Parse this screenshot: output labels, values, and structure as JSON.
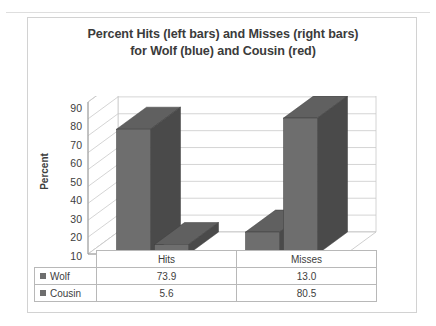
{
  "top_fragment": {
    "ghost_text": "· ·· ··"
  },
  "chart_data": {
    "type": "bar",
    "title_lines": [
      "Percent Hits (left bars) and Misses (right bars)",
      "for Wolf (blue) and Cousin (red)"
    ],
    "title": "Percent Hits (left bars) and Misses (right bars) for Wolf (blue) and Cousin (red)",
    "xlabel": "",
    "ylabel": "Percent",
    "ylim": [
      0,
      90
    ],
    "ytick_step": 10,
    "yticks": [
      "90",
      "80",
      "70",
      "60",
      "50",
      "40",
      "30",
      "20",
      "10",
      "0"
    ],
    "grid": true,
    "three_d": true,
    "legend_position": "data-table",
    "categories": [
      "Hits",
      "Misses"
    ],
    "series": [
      {
        "name": "Wolf",
        "values": [
          73.9,
          13.0
        ],
        "color": "#6e6e6e"
      },
      {
        "name": "Cousin",
        "values": [
          5.6,
          80.5
        ],
        "color": "#6e6e6e"
      }
    ],
    "table": {
      "header": [
        "",
        "Hits",
        "Misses"
      ],
      "rows": [
        {
          "label": "Wolf",
          "values": [
            "73.9",
            "13.0"
          ]
        },
        {
          "label": "Cousin",
          "values": [
            "5.6",
            "80.5"
          ]
        }
      ]
    },
    "colors": {
      "bar_front": "#6e6e6e",
      "bar_side": "#4a4a4a",
      "bar_top": "#606060",
      "gridline": "#c9c9c9",
      "wall": "#ffffff",
      "floor": "#ffffff",
      "text": "#3d3d3d",
      "border": "#d2d2d2"
    }
  }
}
